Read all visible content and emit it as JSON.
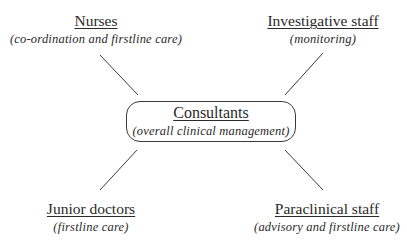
{
  "diagram": {
    "center": {
      "title": "Consultants",
      "subtitle": "(overall clinical management)"
    },
    "nodes": [
      {
        "id": "nurses",
        "title": "Nurses",
        "subtitle": "(co-ordination and firstline care)",
        "position": "top-left"
      },
      {
        "id": "investigative",
        "title": "Investigative staff",
        "subtitle": "(monitoring)",
        "position": "top-right"
      },
      {
        "id": "junior",
        "title": "Junior doctors",
        "subtitle": "(firstline care)",
        "position": "bottom-left"
      },
      {
        "id": "paraclinical",
        "title": "Paraclinical staff",
        "subtitle": "(advisory and firstline care)",
        "position": "bottom-right"
      }
    ],
    "line_color": "#3a3a3a"
  }
}
